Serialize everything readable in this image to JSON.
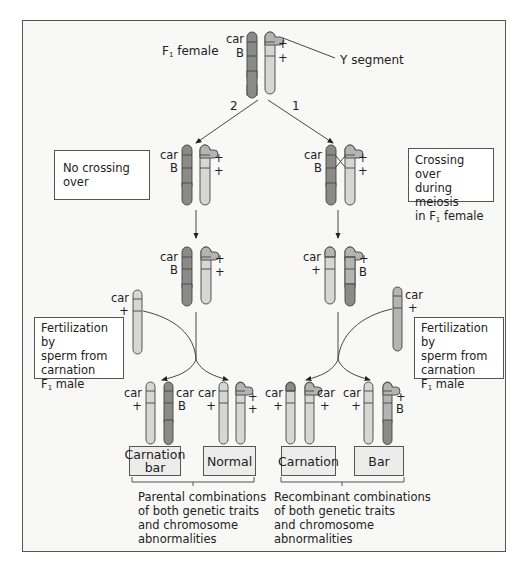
{
  "title_label": {
    "main": "F",
    "sub": "1",
    "rest": " female"
  },
  "y_segment_label": "Y segment",
  "branch_numbers": {
    "left": "2",
    "right": "1"
  },
  "notes": {
    "no_crossing": "No crossing over",
    "crossing": {
      "line1": "Crossing over",
      "line2": "during meiosis",
      "line3_pre": "in F",
      "line3_sub": "1",
      "line3_post": " female"
    },
    "fert_left": {
      "line1": "Fertilization by",
      "line2": "sperm from",
      "line3": "carnation",
      "line4_pre": "F",
      "line4_sub": "1",
      "line4_post": " male"
    },
    "fert_right": {
      "line1": "Fertilization by",
      "line2": "sperm from",
      "line3": "carnation",
      "line4_pre": "F",
      "line4_sub": "1",
      "line4_post": " male"
    }
  },
  "alleles": {
    "car": "car",
    "bar": "B",
    "plus": "+"
  },
  "phenotypes": {
    "carnation_bar": {
      "line1": "Carnation",
      "line2": "bar"
    },
    "normal": "Normal",
    "carnation": "Carnation",
    "bar": "Bar"
  },
  "captions": {
    "parental": [
      "Parental combinations",
      "of both genetic traits",
      "and chromosome",
      "abnormalities"
    ],
    "recombinant": [
      "Recombinant combinations",
      "of both genetic traits",
      "and chromosome",
      "abnormalities"
    ]
  },
  "colors": {
    "dark_chromosome": "#8a8a88",
    "light_chromosome": "#d6d6d4",
    "mid_chromosome": "#b4b4b2",
    "frame_bg": "#f8f8f7",
    "phenotype_box": "#ececeb"
  }
}
